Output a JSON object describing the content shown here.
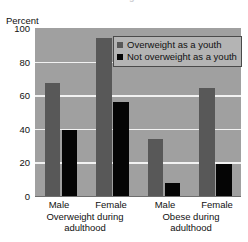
{
  "title_clipped": "Adults Overweight or Obese",
  "chart_data": {
    "type": "bar",
    "title": "Adults Overweight or Obese",
    "xlabel": "",
    "ylabel": "Percent",
    "ylim": [
      0,
      100
    ],
    "yticks": [
      "0",
      "20",
      "40",
      "60",
      "80",
      "100"
    ],
    "grid": true,
    "legend_position": "top-right",
    "categories": [
      "Male",
      "Female",
      "Male",
      "Female"
    ],
    "group_labels": [
      {
        "line1": "Overweight during",
        "line2": "adulthood"
      },
      {
        "line1": "Obese during",
        "line2": "adulthood"
      }
    ],
    "series": [
      {
        "name": "Overweight as a youth",
        "color": "#585858",
        "values": [
          67,
          94,
          34,
          64
        ]
      },
      {
        "name": "Not overweight as a youth",
        "color": "#050505",
        "values": [
          39,
          56,
          8,
          19
        ]
      }
    ]
  },
  "axis": {
    "ylabel": "Percent",
    "tick_100": "100",
    "tick_80": "80",
    "tick_60": "60",
    "tick_40": "40",
    "tick_20": "20",
    "tick_0": "0"
  },
  "legend": {
    "item_1": "Overweight as a youth",
    "item_2": "Not overweight as a youth"
  },
  "xaxis": {
    "tick_1": "Male",
    "tick_2": "Female",
    "tick_3": "Male",
    "tick_4": "Female",
    "group_1_line_1": "Overweight during",
    "group_1_line_2": "adulthood",
    "group_2_line_1": "Obese during",
    "group_2_line_2": "adulthood"
  }
}
